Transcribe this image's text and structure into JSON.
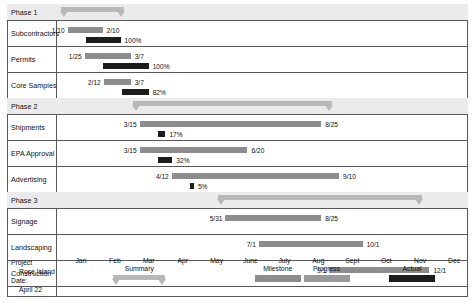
{
  "chart_data": {
    "type": "bar",
    "xlabel": "",
    "ylabel": "",
    "axis": {
      "tick_labels": [
        "Jan",
        "Feb",
        "Mar",
        "Apr",
        "May",
        "June",
        "July",
        "Aug",
        "Sept",
        "Oct",
        "Nov",
        "Dec"
      ],
      "range_start": "1/1",
      "range_end": "12/31"
    },
    "legend": {
      "position": "bottom",
      "entries": [
        {
          "label": "Summary",
          "color": "#b8b8b8"
        },
        {
          "label": "Milestone",
          "color": "#8d8d8d"
        },
        {
          "label": "Progress",
          "color": "#9a9a9a"
        },
        {
          "label": "Actual",
          "color": "#1c1c1c"
        }
      ]
    },
    "rows": [
      {
        "name": "Phase 1",
        "kind": "phase",
        "start": "1/10",
        "end": "3/7",
        "start_frac": 0.026,
        "end_frac": 0.181
      },
      {
        "name": "Subcontractors",
        "kind": "task",
        "start": "1/10",
        "end": "2/10",
        "start_frac": 0.026,
        "end_frac": 0.112,
        "progress": "100%",
        "progress_frac": 1.0
      },
      {
        "name": "Permits",
        "kind": "task",
        "start": "1/25",
        "end": "3/7",
        "start_frac": 0.068,
        "end_frac": 0.181,
        "progress": "100%",
        "progress_frac": 1.0
      },
      {
        "name": "Core Samples",
        "kind": "task",
        "start": "2/12",
        "end": "3/7",
        "start_frac": 0.115,
        "end_frac": 0.181,
        "progress": "82%",
        "progress_frac": 0.82
      },
      {
        "name": "Phase 2",
        "kind": "phase",
        "start": "3/15",
        "end": "9/10",
        "start_frac": 0.203,
        "end_frac": 0.693
      },
      {
        "name": "Shipments",
        "kind": "task",
        "start": "3/15",
        "end": "8/25",
        "start_frac": 0.203,
        "end_frac": 0.649,
        "progress": "17%",
        "progress_frac": 0.17
      },
      {
        "name": "EPA Approval",
        "kind": "task",
        "start": "3/15",
        "end": "6/20",
        "start_frac": 0.203,
        "end_frac": 0.468,
        "progress": "32%",
        "progress_frac": 0.32
      },
      {
        "name": "Advertising",
        "kind": "task",
        "start": "4/12",
        "end": "9/10",
        "start_frac": 0.282,
        "end_frac": 0.693,
        "progress": "5%",
        "progress_frac": 0.05
      },
      {
        "name": "Phase 3",
        "kind": "phase",
        "start": "5/31",
        "end": "12/1",
        "start_frac": 0.414,
        "end_frac": 0.915
      },
      {
        "name": "Signage",
        "kind": "task",
        "start": "5/31",
        "end": "8/25",
        "start_frac": 0.414,
        "end_frac": 0.649,
        "progress": "",
        "progress_frac": 0
      },
      {
        "name": "Landscaping",
        "kind": "task",
        "start": "7/1",
        "end": "10/1",
        "start_frac": 0.496,
        "end_frac": 0.751,
        "progress": "",
        "progress_frac": 0
      },
      {
        "name": "Construction",
        "kind": "task",
        "start": "9/1",
        "end": "12/1",
        "start_frac": 0.669,
        "end_frac": 0.915,
        "progress": "",
        "progress_frac": 0
      }
    ]
  },
  "footer": {
    "project_label": "Project",
    "project_name": "Rose Island",
    "date_label": "Date:",
    "date_value": "April 22"
  }
}
